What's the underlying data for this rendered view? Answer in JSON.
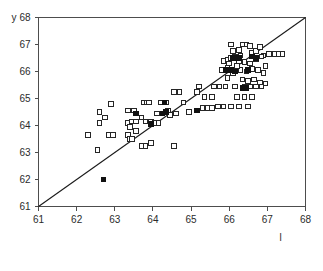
{
  "chart_data": {
    "type": "scatter",
    "title": "",
    "xlabel": "l",
    "ylabel": "y",
    "xlim": [
      61,
      68
    ],
    "ylim": [
      61,
      68
    ],
    "xticks": [
      61,
      62,
      63,
      64,
      65,
      66,
      67,
      68
    ],
    "yticks": [
      61,
      62,
      63,
      64,
      65,
      66,
      67,
      68
    ],
    "grid": false,
    "legend": null,
    "annotations": [
      {
        "name": "identity-line",
        "type": "line",
        "description": "y = x reference line from (61,61) to (68,68)",
        "x": [
          61,
          68
        ],
        "y": [
          61,
          68
        ],
        "color": "#1a1a1a"
      }
    ],
    "series": [
      {
        "name": "open-squares",
        "marker": "open-square",
        "color": "#262626",
        "fill": "#ffffff",
        "points": [
          [
            62.3,
            63.65
          ],
          [
            62.85,
            63.65
          ],
          [
            62.95,
            63.65
          ],
          [
            62.6,
            64.5
          ],
          [
            62.75,
            64.3
          ],
          [
            62.55,
            63.1
          ],
          [
            62.6,
            64.1
          ],
          [
            62.9,
            64.8
          ],
          [
            63.35,
            63.65
          ],
          [
            63.4,
            63.5
          ],
          [
            63.45,
            63.5
          ],
          [
            63.35,
            64.1
          ],
          [
            63.45,
            64.15
          ],
          [
            63.55,
            64.15
          ],
          [
            63.55,
            63.8
          ],
          [
            63.4,
            63.95
          ],
          [
            63.35,
            64.55
          ],
          [
            63.5,
            64.55
          ],
          [
            63.75,
            64.85
          ],
          [
            63.85,
            64.85
          ],
          [
            63.9,
            64.85
          ],
          [
            63.7,
            64.3
          ],
          [
            63.8,
            64.15
          ],
          [
            63.95,
            64.15
          ],
          [
            63.7,
            63.25
          ],
          [
            63.8,
            63.25
          ],
          [
            63.95,
            63.35
          ],
          [
            64.05,
            64.1
          ],
          [
            64.15,
            64.1
          ],
          [
            64.25,
            64.45
          ],
          [
            64.1,
            64.45
          ],
          [
            64.2,
            64.85
          ],
          [
            64.35,
            64.85
          ],
          [
            64.45,
            64.4
          ],
          [
            64.4,
            64.55
          ],
          [
            64.55,
            63.25
          ],
          [
            64.55,
            65.25
          ],
          [
            64.7,
            65.25
          ],
          [
            64.6,
            64.45
          ],
          [
            64.8,
            64.85
          ],
          [
            64.95,
            64.5
          ],
          [
            65.15,
            65.25
          ],
          [
            65.3,
            64.65
          ],
          [
            65.45,
            64.65
          ],
          [
            65.55,
            64.65
          ],
          [
            65.2,
            65.45
          ],
          [
            65.35,
            65.05
          ],
          [
            65.55,
            65.05
          ],
          [
            65.6,
            65.45
          ],
          [
            65.7,
            64.7
          ],
          [
            65.85,
            64.7
          ],
          [
            65.75,
            65.45
          ],
          [
            65.9,
            65.45
          ],
          [
            65.8,
            66.05
          ],
          [
            65.95,
            66.15
          ],
          [
            65.85,
            66.4
          ],
          [
            65.95,
            66.45
          ],
          [
            66.05,
            66.5
          ],
          [
            66.05,
            67.0
          ],
          [
            66.1,
            66.75
          ],
          [
            66.25,
            66.8
          ],
          [
            66.35,
            67.0
          ],
          [
            66.45,
            67.0
          ],
          [
            66.55,
            66.95
          ],
          [
            66.6,
            66.7
          ],
          [
            66.7,
            66.75
          ],
          [
            66.8,
            66.9
          ],
          [
            66.9,
            66.6
          ],
          [
            67.05,
            66.65
          ],
          [
            67.2,
            66.65
          ],
          [
            67.3,
            66.65
          ],
          [
            67.4,
            66.65
          ],
          [
            66.25,
            66.4
          ],
          [
            66.4,
            66.35
          ],
          [
            66.55,
            66.3
          ],
          [
            66.7,
            66.45
          ],
          [
            66.85,
            66.55
          ],
          [
            66.95,
            66.2
          ],
          [
            66.3,
            66.05
          ],
          [
            66.45,
            66.0
          ],
          [
            66.6,
            66.1
          ],
          [
            66.75,
            66.05
          ],
          [
            66.9,
            65.95
          ],
          [
            66.35,
            65.7
          ],
          [
            66.5,
            65.65
          ],
          [
            66.65,
            65.7
          ],
          [
            66.8,
            65.6
          ],
          [
            66.95,
            65.55
          ],
          [
            66.4,
            65.45
          ],
          [
            66.55,
            65.45
          ],
          [
            66.7,
            65.45
          ],
          [
            66.85,
            65.45
          ],
          [
            66.15,
            65.45
          ],
          [
            66.2,
            65.05
          ],
          [
            66.4,
            65.05
          ],
          [
            66.6,
            65.05
          ],
          [
            66.05,
            64.7
          ],
          [
            66.25,
            64.7
          ],
          [
            66.5,
            64.7
          ],
          [
            65.95,
            65.75
          ],
          [
            66.1,
            65.95
          ],
          [
            66.2,
            66.2
          ],
          [
            66.15,
            66.55
          ],
          [
            66.3,
            66.6
          ],
          [
            66.0,
            66.3
          ]
        ]
      },
      {
        "name": "filled-squares",
        "marker": "filled-square",
        "color": "#111111",
        "points": [
          [
            62.7,
            62.0
          ],
          [
            63.95,
            64.05
          ],
          [
            64.25,
            64.45
          ],
          [
            64.35,
            64.5
          ],
          [
            64.3,
            64.85
          ],
          [
            63.55,
            64.45
          ],
          [
            65.15,
            64.55
          ],
          [
            65.9,
            66.05
          ],
          [
            66.05,
            66.05
          ],
          [
            66.15,
            66.0
          ],
          [
            66.1,
            66.5
          ],
          [
            66.25,
            66.5
          ],
          [
            66.35,
            65.4
          ],
          [
            66.5,
            66.05
          ],
          [
            66.6,
            66.55
          ],
          [
            66.7,
            66.5
          ],
          [
            66.45,
            65.4
          ]
        ]
      }
    ]
  }
}
